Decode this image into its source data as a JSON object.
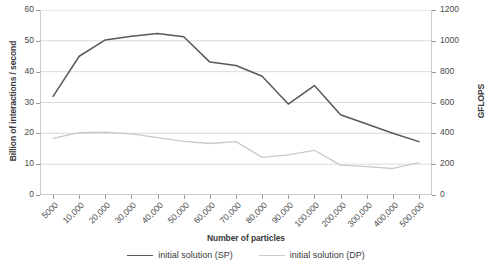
{
  "chart_data": {
    "type": "line",
    "title": "",
    "xlabel": "Number of particles",
    "ylabel": "Billion of interactions / second",
    "ylabel_secondary": "GFLOPS",
    "categories": [
      "5000",
      "10,000",
      "20,000",
      "30,000",
      "40,000",
      "50,000",
      "60,000",
      "70,000",
      "80,000",
      "90,000",
      "100,000",
      "200,000",
      "300,000",
      "400,000",
      "500,000"
    ],
    "ylim": [
      0,
      60
    ],
    "yticks": [
      0,
      10,
      20,
      30,
      40,
      50,
      60
    ],
    "ylim_secondary": [
      0,
      1200
    ],
    "yticks_secondary": [
      0,
      200,
      400,
      600,
      800,
      1000,
      1200
    ],
    "grid": true,
    "legend_position": "bottom",
    "series": [
      {
        "name": "initial solution (SP)",
        "color": "#595959",
        "values": [
          32.0,
          45.0,
          50.3,
          51.5,
          52.4,
          51.3,
          43.1,
          42.0,
          38.5,
          29.5,
          35.5,
          26.0,
          23.0,
          20.0,
          17.3
        ]
      },
      {
        "name": "initial solution (DP)",
        "color": "#c9c9c9",
        "values": [
          18.4,
          20.2,
          20.4,
          19.8,
          18.6,
          17.4,
          16.7,
          17.3,
          12.2,
          13.0,
          14.5,
          9.7,
          9.2,
          8.6,
          10.5
        ]
      }
    ]
  },
  "legend": {
    "items": [
      {
        "label": "initial solution (SP)",
        "color": "#595959",
        "width": "1.8px"
      },
      {
        "label": "initial solution (DP)",
        "color": "#c9c9c9",
        "width": "1.6px"
      }
    ]
  }
}
